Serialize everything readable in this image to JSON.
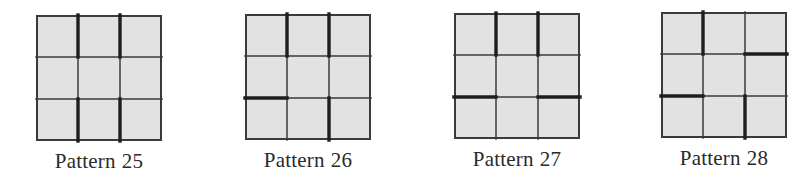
{
  "figure": {
    "colors": {
      "cell_fill": "#e2e2e2",
      "line": "#3a3a3a",
      "thick_line": "#1e1e1e",
      "label_text": "#2a2a2a"
    },
    "grid_size": 3,
    "patterns": [
      {
        "name": "Pattern",
        "number": "25",
        "position": {
          "x": 36,
          "y": 15
        },
        "vertical_thick": [
          [
            true,
            false,
            true
          ],
          [
            true,
            false,
            true
          ]
        ],
        "horizontal_thick": [
          [
            false,
            false,
            false
          ],
          [
            false,
            false,
            false
          ]
        ]
      },
      {
        "name": "Pattern",
        "number": "26",
        "position": {
          "x": 245,
          "y": 14
        },
        "vertical_thick": [
          [
            true,
            false,
            false
          ],
          [
            true,
            false,
            true
          ]
        ],
        "horizontal_thick": [
          [
            false,
            false,
            false
          ],
          [
            true,
            false,
            false
          ]
        ]
      },
      {
        "name": "Pattern",
        "number": "27",
        "position": {
          "x": 454,
          "y": 13
        },
        "vertical_thick": [
          [
            true,
            false,
            false
          ],
          [
            true,
            false,
            false
          ]
        ],
        "horizontal_thick": [
          [
            false,
            false,
            false
          ],
          [
            true,
            false,
            true
          ]
        ]
      },
      {
        "name": "Pattern",
        "number": "28",
        "position": {
          "x": 661,
          "y": 12
        },
        "vertical_thick": [
          [
            true,
            false,
            false
          ],
          [
            false,
            false,
            true
          ]
        ],
        "horizontal_thick": [
          [
            false,
            false,
            true
          ],
          [
            true,
            false,
            false
          ]
        ]
      }
    ]
  }
}
